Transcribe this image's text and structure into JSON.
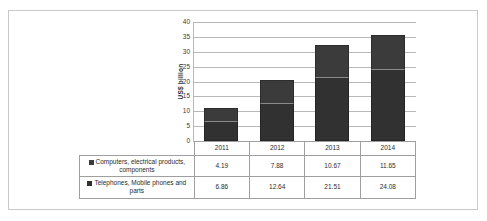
{
  "chart_data": {
    "type": "bar",
    "stacked": true,
    "title": "",
    "xlabel": "",
    "ylabel": "US$ billion",
    "categories": [
      "2011",
      "2012",
      "2013",
      "2014"
    ],
    "series": [
      {
        "name": "Telephones, Mobile phones and parts",
        "values": [
          6.86,
          12.64,
          21.51,
          24.08
        ],
        "color": "#313131",
        "legend_marker": "square-marker"
      },
      {
        "name": "Computers, electrical products, components",
        "values": [
          4.19,
          7.88,
          10.67,
          11.65
        ],
        "color": "#3b3b3b",
        "legend_marker": "square-marker"
      }
    ],
    "totals": [
      11.05,
      20.52,
      32.18,
      35.73
    ],
    "ylim": [
      0,
      40
    ],
    "yticks": [
      "0",
      "5",
      "10",
      "15",
      "20",
      "25",
      "30",
      "35",
      "40"
    ],
    "grid": true,
    "legend_position": "data-table-left"
  },
  "table": {
    "row_order": [
      "Computers, electrical products, components",
      "Telephones, Mobile phones and parts"
    ],
    "header": [
      "",
      "2011",
      "2012",
      "2013",
      "2014"
    ],
    "rows": [
      {
        "label": "Computers, electrical products, components",
        "values": [
          "4.19",
          "7.88",
          "10.67",
          "11.65"
        ]
      },
      {
        "label": "Telephones, Mobile phones and parts",
        "values": [
          "6.86",
          "12.64",
          "21.51",
          "24.08"
        ]
      }
    ]
  }
}
